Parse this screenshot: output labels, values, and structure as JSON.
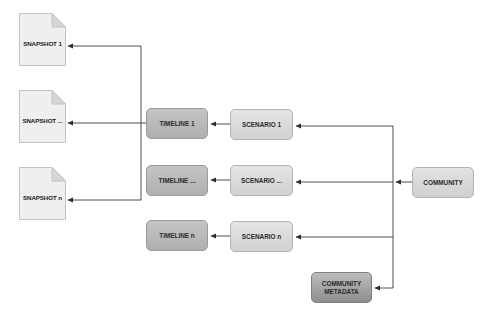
{
  "diagram": {
    "snapshots": [
      {
        "label": "SNAPSHOT 1"
      },
      {
        "label": "SNAPSHOT ..."
      },
      {
        "label": "SNAPSHOT n"
      }
    ],
    "timelines": [
      {
        "label": "TIMELINE 1"
      },
      {
        "label": "TIMELINE ..."
      },
      {
        "label": "TIMELINE n"
      }
    ],
    "scenarios": [
      {
        "label": "SCENARIO 1"
      },
      {
        "label": "SCENARIO ..."
      },
      {
        "label": "SCENARIO n"
      }
    ],
    "community": {
      "label": "COMMUNITY"
    },
    "community_metadata": {
      "label": "COMMUNITY\nMETADATA"
    },
    "edges": [
      {
        "from": "COMMUNITY",
        "to": "SCENARIO 1"
      },
      {
        "from": "COMMUNITY",
        "to": "SCENARIO ..."
      },
      {
        "from": "COMMUNITY",
        "to": "SCENARIO n"
      },
      {
        "from": "COMMUNITY",
        "to": "COMMUNITY METADATA"
      },
      {
        "from": "SCENARIO 1",
        "to": "TIMELINE 1"
      },
      {
        "from": "SCENARIO ...",
        "to": "TIMELINE ..."
      },
      {
        "from": "SCENARIO n",
        "to": "TIMELINE n"
      },
      {
        "from": "TIMELINE 1",
        "to": "SNAPSHOT 1"
      },
      {
        "from": "TIMELINE 1",
        "to": "SNAPSHOT ..."
      },
      {
        "from": "TIMELINE 1",
        "to": "SNAPSHOT n"
      }
    ],
    "colors": {
      "line": "#3a3a3a",
      "timeline_fill": "#bcbcbc",
      "scenario_fill": "#dcdcdc",
      "community_fill": "#d9d9d9",
      "metadata_fill": "#a5a5a5",
      "document_fill": "#efefef",
      "document_fold": "#d6d6d6"
    }
  }
}
